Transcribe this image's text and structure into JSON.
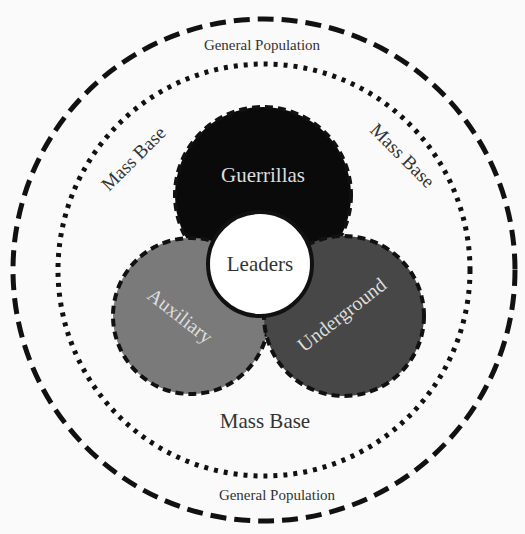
{
  "diagram": {
    "outer_ring_top_label": "General Population",
    "outer_ring_bottom_label": "General Population",
    "mass_base_left": "Mass Base",
    "mass_base_right": "Mass Base",
    "mass_base_bottom": "Mass Base",
    "guerrillas": "Guerrillas",
    "leaders": "Leaders",
    "auxiliary": "Auxiliary",
    "underground": "Underground"
  },
  "colors": {
    "background": "#fafafa",
    "guerrillas": "#0a0a0a",
    "auxiliary": "#7a7a7a",
    "underground": "#474747",
    "leaders": "#ffffff",
    "stroke": "#111111",
    "text_dark": "#333333",
    "text_light": "#dddddd"
  }
}
